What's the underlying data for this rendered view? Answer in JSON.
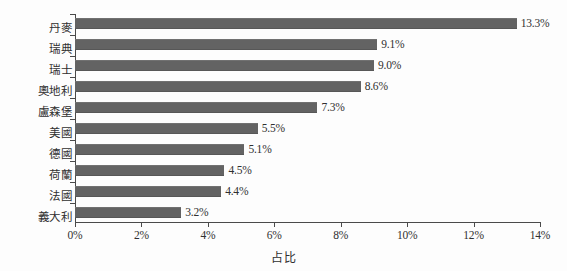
{
  "chart_data": {
    "type": "bar",
    "orientation": "horizontal",
    "title": "",
    "xlabel": "占比",
    "ylabel": "",
    "categories": [
      "丹麥",
      "瑞典",
      "瑞士",
      "奧地利",
      "盧森堡",
      "美國",
      "德國",
      "荷蘭",
      "法國",
      "義大利"
    ],
    "values": [
      13.3,
      9.1,
      9.0,
      8.6,
      7.3,
      5.5,
      5.1,
      4.5,
      4.4,
      3.2
    ],
    "value_labels": [
      "13.3%",
      "9.1%",
      "9.0%",
      "8.6%",
      "7.3%",
      "5.5%",
      "5.1%",
      "4.5%",
      "4.4%",
      "3.2%"
    ],
    "xlim": [
      0,
      14
    ],
    "xticks": [
      0,
      2,
      4,
      6,
      8,
      10,
      12,
      14
    ],
    "xtick_labels": [
      "0%",
      "2%",
      "4%",
      "6%",
      "8%",
      "10%",
      "12%",
      "14%"
    ],
    "grid": false,
    "legend": null,
    "bar_color": "#636363",
    "axis_color": "#4a4a4a",
    "text_color": "#303030",
    "background": "#fdfdfd"
  }
}
